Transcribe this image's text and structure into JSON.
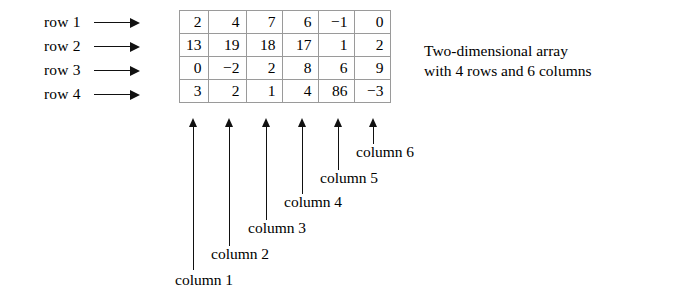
{
  "figure": {
    "caption_line1": "Two-dimensional array",
    "caption_line2": "with 4 rows and 6 columns"
  },
  "row_labels": [
    {
      "label": "row 1"
    },
    {
      "label": "row 2"
    },
    {
      "label": "row 3"
    },
    {
      "label": "row 4"
    }
  ],
  "column_labels": [
    {
      "label": "column 1"
    },
    {
      "label": "column 2"
    },
    {
      "label": "column 3"
    },
    {
      "label": "column 4"
    },
    {
      "label": "column 5"
    },
    {
      "label": "column 6"
    }
  ],
  "matrix": {
    "rows": 4,
    "columns": 6,
    "values": [
      [
        "2",
        "4",
        "7",
        "6",
        "−1",
        "0"
      ],
      [
        "13",
        "19",
        "18",
        "17",
        "1",
        "2"
      ],
      [
        "0",
        "−2",
        "2",
        "8",
        "6",
        "9"
      ],
      [
        "3",
        "2",
        "1",
        "4",
        "86",
        "−3"
      ]
    ]
  },
  "colors": {
    "background": "#ffffff",
    "text": "#000000",
    "grid_line": "#9a9a9a",
    "outer_border": "#5a5a5a",
    "arrow": "#111111"
  }
}
